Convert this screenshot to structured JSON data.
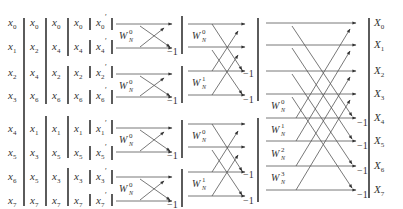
{
  "diagram": {
    "type": "FFT butterfly (radix-2 DIT, N=8)",
    "input_columns": [
      {
        "name": "original",
        "labels": [
          "x0",
          "x1",
          "x2",
          "x3",
          "x4",
          "x5",
          "x6",
          "x7"
        ]
      },
      {
        "name": "split-1",
        "labels": [
          "x0",
          "x2",
          "x4",
          "x6",
          "x1",
          "x3",
          "x5",
          "x7"
        ]
      },
      {
        "name": "split-2",
        "labels": [
          "x0",
          "x4",
          "x2",
          "x6",
          "x1",
          "x5",
          "x3",
          "x7"
        ]
      },
      {
        "name": "split-3",
        "labels": [
          "x0",
          "x4",
          "x2",
          "x6",
          "x1",
          "x5",
          "x3",
          "x7"
        ]
      },
      {
        "name": "bit-reversed",
        "labels": [
          "x0'",
          "x4'",
          "x2'",
          "x6'",
          "x1'",
          "x5'",
          "x3'",
          "x7'"
        ]
      }
    ],
    "stages": [
      {
        "name": "stage-1",
        "twiddles": [
          "W_N^0",
          "W_N^0",
          "W_N^0",
          "W_N^0"
        ],
        "neg_label": "-1"
      },
      {
        "name": "stage-2",
        "twiddles": [
          "W_N^0",
          "W_N^1",
          "W_N^0",
          "W_N^1"
        ],
        "neg_label": "-1"
      },
      {
        "name": "stage-3",
        "twiddles": [
          "W_N^0",
          "W_N^1",
          "W_N^2",
          "W_N^3"
        ],
        "neg_label": "-1"
      }
    ],
    "outputs": [
      "X0",
      "X1",
      "X2",
      "X3",
      "X4",
      "X5",
      "X6",
      "X7"
    ],
    "twiddle_base": "W",
    "twiddle_sub": "N",
    "neg_one": "−1"
  }
}
